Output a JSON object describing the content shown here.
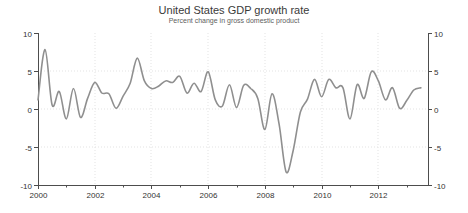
{
  "header": {
    "title": "United States GDP growth rate",
    "subtitle": "Percent change in gross domestic product"
  },
  "chart_data": {
    "type": "line",
    "title": "United States GDP growth rate",
    "subtitle": "Percent change in gross domestic product",
    "series_name": "US quarterly GDP growth (annualized %)",
    "frequency": "quarterly",
    "start_period": "2000 Q1",
    "end_period": "2013 Q3",
    "values": [
      1.2,
      7.8,
      0.5,
      2.3,
      -1.3,
      2.7,
      -1.1,
      1.4,
      3.5,
      2.1,
      2.0,
      0.1,
      1.7,
      3.4,
      6.7,
      3.7,
      2.7,
      3.0,
      3.7,
      3.5,
      4.3,
      2.1,
      3.4,
      2.3,
      4.9,
      1.2,
      0.4,
      3.2,
      0.2,
      3.1,
      2.7,
      1.4,
      -2.7,
      2.0,
      -2.0,
      -8.3,
      -5.4,
      -0.4,
      1.3,
      3.9,
      1.6,
      3.9,
      2.8,
      2.8,
      -1.3,
      3.2,
      1.4,
      4.9,
      3.7,
      1.2,
      2.8,
      0.1,
      1.1,
      2.5,
      2.8
    ],
    "xlim": [
      2000,
      2013.75
    ],
    "ylim": [
      -10,
      10
    ],
    "y_axis": {
      "tick_values": [
        10,
        5,
        0,
        -5,
        -10
      ],
      "tick_labels": [
        "10",
        "5",
        "0",
        "-5",
        "-10"
      ],
      "sides": [
        "left",
        "right"
      ]
    },
    "x_axis": {
      "tick_years": [
        2000,
        2001,
        2002,
        2003,
        2004,
        2005,
        2006,
        2007,
        2008,
        2009,
        2010,
        2011,
        2012,
        2013
      ],
      "labeled_years": [
        2000,
        2002,
        2004,
        2006,
        2008,
        2010,
        2012
      ]
    },
    "grid": {
      "h_values": [
        5,
        0,
        -5
      ],
      "v_years": [
        2002,
        2004,
        2006,
        2008,
        2010,
        2012
      ]
    },
    "colors": {
      "line": "#8f8f8f",
      "axis": "#4d4d4d",
      "grid": "#e3e3e3",
      "tick_text": "#333333",
      "title_text": "#3a3a3a",
      "subtitle_text": "#606060",
      "background": "#ffffff"
    }
  }
}
